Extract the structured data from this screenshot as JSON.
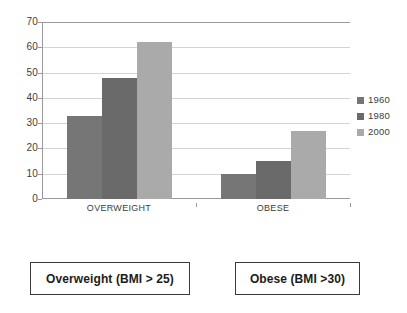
{
  "chart_data": {
    "type": "bar",
    "title": "",
    "subtitle": "",
    "xlabel": "",
    "ylabel": "",
    "categories": [
      "OVERWEIGHT",
      "OBESE"
    ],
    "series": [
      {
        "name": "1960",
        "values": [
          33,
          10
        ],
        "color": "#767676"
      },
      {
        "name": "1980",
        "values": [
          48,
          15
        ],
        "color": "#6a6a6a"
      },
      {
        "name": "2000",
        "values": [
          62,
          27
        ],
        "color": "#aaaaaa"
      }
    ],
    "ylim": [
      0,
      70
    ],
    "ytick_step": 10,
    "yticks": [
      0,
      10,
      20,
      30,
      40,
      50,
      60,
      70
    ],
    "ytick_labels": [
      "0",
      "10",
      "20",
      "30",
      "40",
      "50",
      "60",
      "70"
    ],
    "grid": "horizontal",
    "legend_position": "right",
    "bar_gap_within_group": 0,
    "annotations": []
  },
  "captions": [
    {
      "text": "Overweight (BMI > 25)"
    },
    {
      "text": "Obese (BMI >30)"
    }
  ]
}
